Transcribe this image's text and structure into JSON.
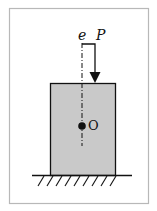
{
  "diagram": {
    "type": "eccentric-load-column",
    "labels": {
      "eccentricity": "e",
      "load": "P",
      "centroid": "O"
    },
    "colors": {
      "frame": "#b8b8b8",
      "block_fill": "#c9c9c9",
      "stroke": "#111111",
      "background": "#ffffff"
    }
  }
}
